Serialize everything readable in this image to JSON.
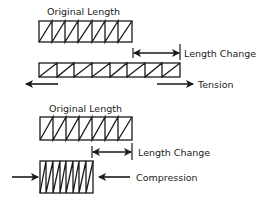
{
  "diagram": {
    "ink_color": "#1a1a1a",
    "background": "#ffffff",
    "tension_panel": {
      "original_label": "Original Length",
      "length_change_label": "Length Change",
      "force_label": "Tension",
      "original_sections": 7,
      "stretched_sections": 8
    },
    "compression_panel": {
      "original_label": "Original Length",
      "length_change_label": "Length Change",
      "force_label": "Compression",
      "original_sections": 7,
      "compressed_sections": 8
    }
  }
}
